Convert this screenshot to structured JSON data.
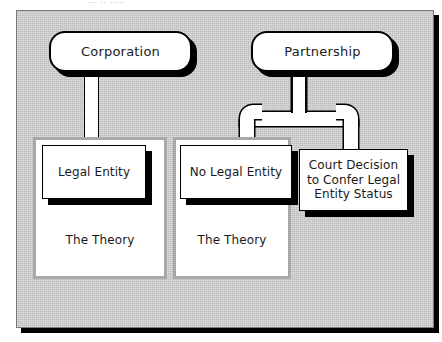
{
  "page": {
    "top_caption": "··· ·· ·····",
    "background_color": "#ffffff",
    "canvas_color": "#c9c9c9",
    "canvas_border_color": "#7a7a7a",
    "shadow_color": "#000000",
    "frame_color": "#a8a8a8",
    "text_color": "#1a1a1a"
  },
  "diagram": {
    "type": "hierarchy-flowchart",
    "roots": [
      {
        "id": "corporation",
        "label": "Corporation"
      },
      {
        "id": "partnership",
        "label": "Partnership"
      }
    ],
    "groups": [
      {
        "id": "group-left",
        "caption": "The Theory",
        "node": {
          "id": "legal-entity",
          "label": "Legal Entity"
        },
        "parent": "corporation"
      },
      {
        "id": "group-middle",
        "caption": "The Theory",
        "node": {
          "id": "no-legal-entity",
          "label": "No Legal Entity"
        },
        "parent": "partnership"
      }
    ],
    "standalone_nodes": [
      {
        "id": "court-decision",
        "label": "Court Decision to Confer Legal Entity Status",
        "line1": "Court Decision",
        "line2": "to Confer Legal",
        "line3": "Entity Status",
        "parent": "partnership"
      }
    ],
    "edges": [
      {
        "from": "corporation",
        "to": "legal-entity"
      },
      {
        "from": "partnership",
        "to": "no-legal-entity"
      },
      {
        "from": "partnership",
        "to": "court-decision"
      }
    ]
  }
}
